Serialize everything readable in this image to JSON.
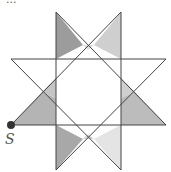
{
  "diagram": {
    "title_cut": "...",
    "point_label": "S",
    "colors": {
      "dark": "#999999",
      "mid": "#bdbdbd",
      "light": "#e2e2e2",
      "line": "#444444"
    }
  }
}
